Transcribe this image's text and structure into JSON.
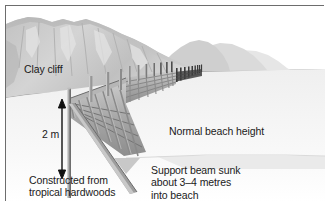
{
  "labels": {
    "clay_cliff": "Clay cliff",
    "height_measure": "2 m",
    "normal_beach_height": "Normal beach height",
    "construction_material": "Constructed from\ntropical hardwoods",
    "support_beam": "Support beam sunk\nabout 3–4 metres\ninto beach"
  },
  "colors": {
    "frame_border": "#6d6d6d",
    "background": "#ffffff",
    "sky": "#ffffff",
    "cliff_face": "#c9c9c9",
    "cliff_shadow": "#b0b0b0",
    "cliff_highlight": "#dcdcdc",
    "distant_headland": "#d8d8d8",
    "sea": "#b5b5b5",
    "surf_white": "#ffffff",
    "beach_light": "#f4f4f4",
    "beach_wet": "#e2e2e2",
    "timber_light": "#d0d0d0",
    "timber_mid": "#9b9b9b",
    "timber_dark": "#6f6f6f",
    "timber_darkest": "#3a3a3a",
    "text": "#1a1a1a"
  },
  "scene_elements": {
    "cliff": "clay cliff rising at left and receding to the right",
    "sea": "grey sea occupying the right half with white breaking waves",
    "beach": "pale sandy beach in the foreground",
    "groyne": "timber groyne of vertical posts and horizontal planks running in perspective from lower-left to upper-right",
    "support_beam": "diagonal raking timber beam driven into the beach",
    "measure_arrow": "double-headed vertical arrow marking the 2 m post height"
  },
  "annotations": {
    "arrow_style": "double-headed vertical arrow",
    "dash_type": "en dash in 3–4"
  }
}
